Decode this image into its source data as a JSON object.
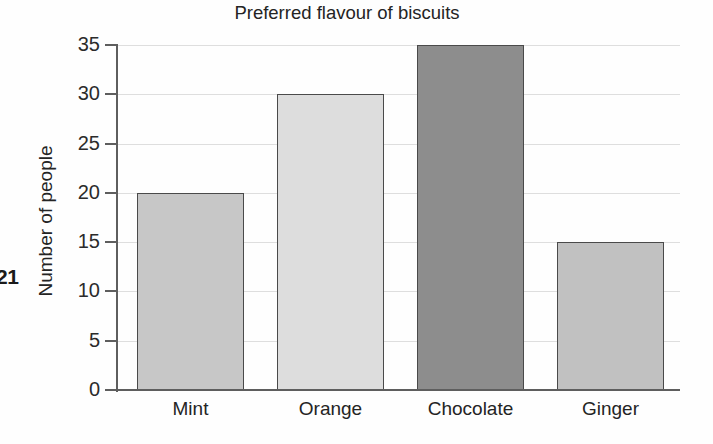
{
  "page_number": "21",
  "chart_data": {
    "type": "bar",
    "title": "Preferred flavour of biscuits",
    "xlabel": "",
    "ylabel": "Number of people",
    "categories": [
      "Mint",
      "Orange",
      "Chocolate",
      "Ginger"
    ],
    "values": [
      20,
      30,
      35,
      15
    ],
    "ylim": [
      0,
      35
    ],
    "ytick_step": 5,
    "ytick_labels": [
      "0",
      "5",
      "10",
      "15",
      "20",
      "25",
      "30",
      "35"
    ],
    "grid": true,
    "legend": false,
    "bar_colors": [
      "#c7c7c7",
      "#dddddd",
      "#8d8d8d",
      "#c1c1c1"
    ],
    "bar_border_color": "#4a4a4a",
    "gridline_color": "#dedede",
    "axis_color": "#5e5e5e"
  }
}
